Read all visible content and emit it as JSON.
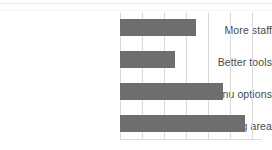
{
  "chart_data": {
    "type": "bar",
    "orientation": "horizontal",
    "title": "",
    "subtitle": "",
    "xlabel": "",
    "ylabel": "",
    "categories": [
      "More staff",
      "Better tools",
      "Healthier menu options",
      "Larger dining area"
    ],
    "values": [
      3.5,
      2.5,
      4.7,
      5.7
    ],
    "series": [
      {
        "name": "",
        "values": [
          3.5,
          2.5,
          4.7,
          5.7
        ]
      }
    ],
    "xlim": [
      0,
      6.5
    ],
    "tick_labels": [],
    "grid": "vertical",
    "gridline_count": 7,
    "legend": "none",
    "annotations": [],
    "bar_color": "#6e6e6e",
    "gridline_color": "#dadada",
    "label_color": "#4a4a4a",
    "background_color": "#ffffff"
  },
  "labels": {
    "category_0": "More staff",
    "category_1": "Better tools",
    "category_2": "Healthier menu options",
    "category_3": "Larger dining area"
  }
}
